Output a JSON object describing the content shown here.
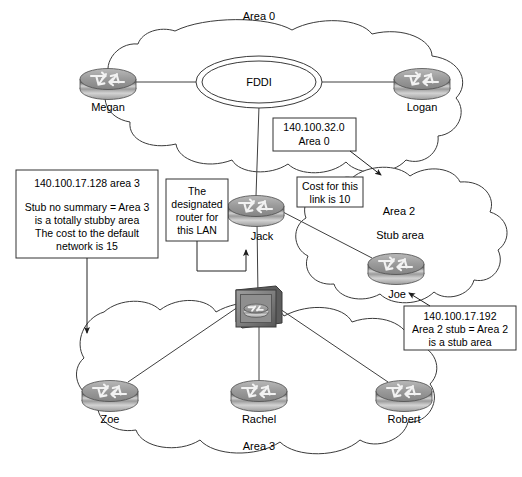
{
  "diagram": {
    "title_text": "OSPF multi-area network diagram",
    "background_color": "#ffffff",
    "line_color": "#3a3a3a",
    "text_color": "#000000"
  },
  "areas": [
    {
      "id": "area-0",
      "label": "Area 0",
      "sublabel": ""
    },
    {
      "id": "area-2",
      "label": "Area 2",
      "sublabel": "Stub area"
    },
    {
      "id": "area-3",
      "label": "Area 3",
      "sublabel": ""
    }
  ],
  "media": {
    "fddi_label": "FDDI"
  },
  "routers": [
    {
      "id": "megan",
      "label": "Megan",
      "icon": "router-icon"
    },
    {
      "id": "logan",
      "label": "Logan",
      "icon": "router-icon"
    },
    {
      "id": "jack",
      "label": "Jack",
      "icon": "router-icon"
    },
    {
      "id": "joe",
      "label": "Joe",
      "icon": "router-icon"
    },
    {
      "id": "zoe",
      "label": "Zoe",
      "icon": "router-icon"
    },
    {
      "id": "rachel",
      "label": "Rachel",
      "icon": "router-icon"
    },
    {
      "id": "robert",
      "label": "Robert",
      "icon": "router-icon"
    }
  ],
  "switch": {
    "id": "lan-switch",
    "icon": "lan-switch-icon",
    "label": ""
  },
  "annotations": [
    {
      "id": "area3-config",
      "lines": [
        "140.100.17.128 area 3",
        "",
        "Stub no summary = Area 3",
        "is a totally stubby area",
        "The cost to the default",
        "network is 15"
      ]
    },
    {
      "id": "designated-router",
      "lines": [
        "The",
        "designated",
        "router for",
        "this LAN"
      ]
    },
    {
      "id": "backbone-network",
      "lines": [
        "140.100.32.0",
        "Area 0"
      ]
    },
    {
      "id": "link-cost",
      "lines": [
        "Cost for this",
        "link is 10"
      ]
    },
    {
      "id": "area2-stub-config",
      "lines": [
        "140.100.17.192",
        "Area 2 stub = Area 2",
        "is a stub area"
      ]
    }
  ]
}
